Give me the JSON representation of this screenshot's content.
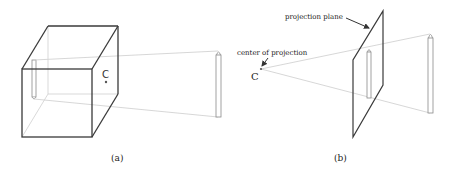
{
  "figure_a": {
    "center_label": "C",
    "caption": "(a)"
  },
  "figure_b": {
    "center_label": "C",
    "center_annotation": "center of projection",
    "plane_annotation": "projection plane",
    "caption": "(b)"
  },
  "colors": {
    "edge": "#3a3a3a",
    "ray": "#d2d2d2",
    "background": "#ffffff"
  }
}
